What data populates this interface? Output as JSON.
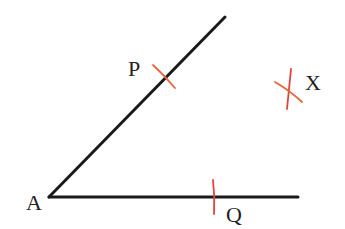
{
  "diagram": {
    "colors": {
      "line": "#1a1a1a",
      "arc": "#e8643c",
      "arc_alt": "#e0453a",
      "label": "#222222",
      "background": "#ffffff"
    },
    "vertex": {
      "label": "A",
      "x": 49,
      "y": 197
    },
    "rays": [
      {
        "name": "ray-AP",
        "from": [
          49,
          197
        ],
        "to": [
          225,
          17
        ]
      },
      {
        "name": "ray-AQ",
        "from": [
          49,
          197
        ],
        "to": [
          298,
          197
        ]
      }
    ],
    "points": [
      {
        "label": "A",
        "label_x": 26,
        "label_y": 210
      },
      {
        "label": "P",
        "label_x": 128,
        "label_y": 76
      },
      {
        "label": "Q",
        "label_x": 226,
        "label_y": 222
      },
      {
        "label": "X",
        "label_x": 305,
        "label_y": 90
      }
    ],
    "arc_marks": [
      {
        "name": "arc-P",
        "path": "M153,65 Q164,75 175,88"
      },
      {
        "name": "arc-Q",
        "path": "M213,180 Q215,197 214,214"
      },
      {
        "name": "arc-X-1",
        "path": "M291,69 Q289,89 287,109"
      },
      {
        "name": "arc-X-2",
        "path": "M275,82 Q289,90 302,102"
      }
    ]
  }
}
